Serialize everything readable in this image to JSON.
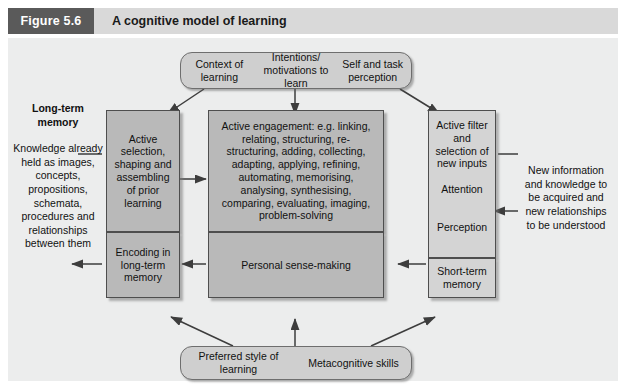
{
  "header": {
    "figure_number": "Figure 5.6",
    "title": "A cognitive model of learning",
    "number_bg": "#5a5a5a",
    "bar_bg": "#d9d9d9"
  },
  "canvas": {
    "background": "#eceded"
  },
  "top_band": {
    "items": [
      {
        "label": "Context of learning"
      },
      {
        "label": "Intentions/ motivations to learn"
      },
      {
        "label": "Self and task perception"
      }
    ]
  },
  "bottom_band": {
    "items": [
      {
        "label": "Preferred style of learning"
      },
      {
        "label": "Metacognitive skills"
      }
    ]
  },
  "left_column": {
    "heading": "Long-term memory",
    "body": "Knowledge already held as images, concepts, propositions, schemata, procedures and relationships between them"
  },
  "right_column": {
    "body": "New information and knowledge to be acquired and new relationships to be understood"
  },
  "left_boxes": {
    "upper": "Active selection, shaping and assembling of prior learning",
    "lower": "Encoding in long-term memory"
  },
  "center_box": {
    "upper": "Active engagement: e.g. linking, relating, structuring, re-structuring, adding, collecting, adapting, applying, refining, automating, memorising, analysing, synthesising, comparing, evaluating, imaging, problem-solving",
    "lower": "Personal sense-making"
  },
  "right_boxes": {
    "upper": "Active filter and selection of new inputs",
    "mid_1": "Attention",
    "mid_2": "Perception",
    "lower": "Short-term memory"
  },
  "colors": {
    "node_grey": "#b9b9b9",
    "node_grey_light": "#d4d4d4",
    "band_grey": "#cfcfcf",
    "stroke": "#4e4e4e",
    "text": "#111111"
  }
}
